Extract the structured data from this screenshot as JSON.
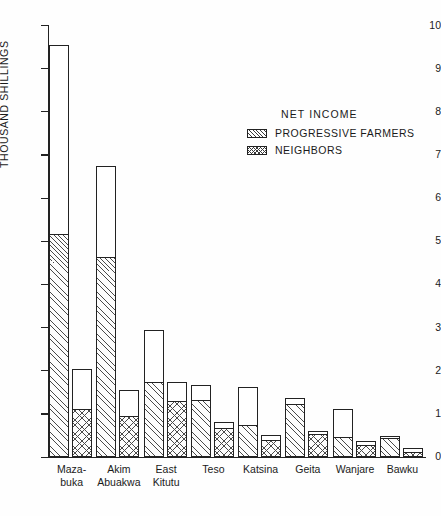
{
  "chart_data": {
    "type": "bar",
    "title": "",
    "xlabel": "",
    "ylabel": "THOUSAND SHILLINGS",
    "ylim": [
      0,
      10
    ],
    "ytick_labels": [
      "0",
      "1",
      "2",
      "3",
      "4",
      "5",
      "6",
      "7",
      "8",
      "9",
      "10"
    ],
    "grid": false,
    "legend_position": "upper right",
    "legend_title": "NET INCOME",
    "categories": [
      "Maza-\nbuka",
      "Akim\nAbuakwa",
      "East\nKitutu",
      "Teso",
      "Katsina",
      "Geita",
      "Wanjare",
      "Bawku"
    ],
    "category_lines": [
      [
        "Maza-",
        "buka"
      ],
      [
        "Akim",
        "Abuakwa"
      ],
      [
        "East",
        "Kitutu"
      ],
      [
        "Teso",
        ""
      ],
      [
        "Katsina",
        ""
      ],
      [
        "Geita",
        ""
      ],
      [
        "Wanjare",
        ""
      ],
      [
        "Bawku",
        ""
      ]
    ],
    "series": [
      {
        "name": "PROGRESSIVE FARMERS",
        "pattern": "diagonal-hatch",
        "total_values": [
          9.55,
          6.75,
          2.95,
          1.68,
          1.62,
          1.38,
          1.12,
          0.48
        ],
        "net_income_values": [
          5.15,
          4.62,
          1.72,
          1.3,
          0.72,
          1.2,
          0.45,
          0.42
        ]
      },
      {
        "name": "NEIGHBORS",
        "pattern": "cross-hatch",
        "total_values": [
          2.05,
          1.55,
          1.75,
          0.82,
          0.52,
          0.6,
          0.38,
          0.2
        ],
        "net_income_values": [
          1.1,
          0.92,
          1.28,
          0.65,
          0.38,
          0.5,
          0.25,
          0.1
        ]
      }
    ]
  },
  "legend": {
    "title": "NET INCOME",
    "items": [
      {
        "label": "PROGRESSIVE FARMERS",
        "swatch": "diagonal-hatch-swatch"
      },
      {
        "label": "NEIGHBORS",
        "swatch": "cross-hatch-swatch"
      }
    ]
  },
  "axes": {
    "y_title": "THOUSAND SHILLINGS",
    "y_ticks": [
      "10",
      "9",
      "8",
      "7",
      "6",
      "5",
      "4",
      "3",
      "2",
      "1",
      "0"
    ]
  },
  "caption": ""
}
